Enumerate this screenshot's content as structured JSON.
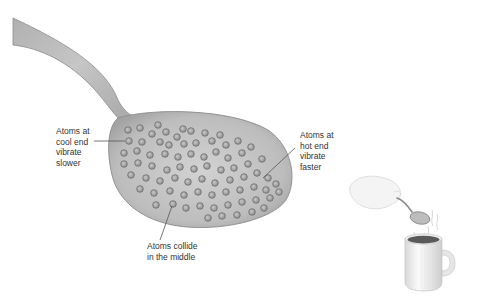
{
  "diagram": {
    "labels": {
      "cool_end": "Atoms at\ncool end\nvibrate\nslower",
      "hot_end": "Atoms at\nhot end\nvibrate\nfaster",
      "middle": "Atoms collide\nin the middle"
    },
    "icons": {
      "spoon": "spoon-illustration",
      "atom": "atom-circle",
      "hand": "hand-icon",
      "mug": "mug-icon",
      "steam": "steam-icon"
    },
    "colors": {
      "spoon_fill": "#b5b5b5",
      "spoon_edge": "#8c8c8c",
      "atom_fill": "#a8a8a8",
      "atom_edge": "#6e6e6e",
      "text": "#333333",
      "leader_line": "#555555",
      "mug_fill": "#f2f2f2",
      "coffee": "#555555"
    }
  }
}
